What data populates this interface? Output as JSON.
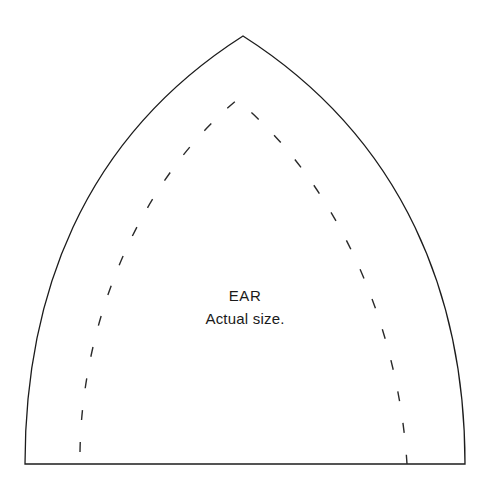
{
  "document": {
    "type": "sewing-pattern-template",
    "background_color": "#ffffff",
    "width": 490,
    "height": 493
  },
  "labels": {
    "title": "EAR",
    "subtitle": "Actual size."
  },
  "pattern": {
    "outline": {
      "name": "cut-line",
      "style": "solid",
      "stroke_color": "#1c1c1c",
      "stroke_width": 1.3,
      "apex": {
        "x": 243,
        "y": 36
      },
      "bottom_left": {
        "x": 25,
        "y": 464
      },
      "bottom_right": {
        "x": 465,
        "y": 464
      },
      "path": "M 25 464 C 25 300, 80 140, 243 36 C 406 140, 465 300, 465 464 Z"
    },
    "seam_line": {
      "name": "seam-allowance-line",
      "style": "dashed",
      "stroke_color": "#2a2a2a",
      "stroke_width": 1.4,
      "dash_length": 10,
      "dash_gap": 22,
      "apex": {
        "x": 237,
        "y": 100
      },
      "bottom_left": {
        "x": 80,
        "y": 452
      },
      "bottom_right": {
        "x": 407,
        "y": 464
      },
      "path": "M 80 452 C 82 320, 140 180, 237 100 C 334 180, 398 320, 407 464"
    },
    "baseline": {
      "name": "fold-baseline",
      "style": "solid",
      "y": 464,
      "x_start": 25,
      "x_end": 465
    }
  }
}
